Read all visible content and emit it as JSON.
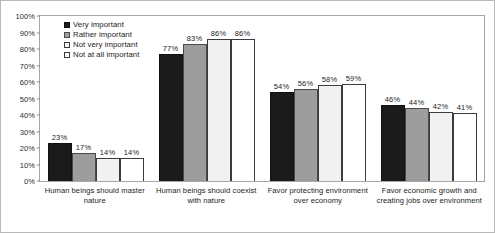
{
  "chart_data": {
    "type": "bar",
    "title": "",
    "xlabel": "",
    "ylabel": "",
    "ylim": [
      0,
      100
    ],
    "grid": false,
    "legend_position": "top-left-inside",
    "categories": [
      "Human beings should master nature",
      "Human beings should coexist with nature",
      "Favor protecting environment over economy",
      "Favor economic growth and creating jobs over environment"
    ],
    "series": [
      {
        "name": "Very important",
        "color": "#1b1b1b",
        "values": [
          23,
          77,
          54,
          46
        ]
      },
      {
        "name": "Rather important",
        "color": "#9d9d9d",
        "values": [
          17,
          83,
          56,
          44
        ]
      },
      {
        "name": "Not very important",
        "color": "#f1f1f1",
        "values": [
          14,
          86,
          58,
          42
        ]
      },
      {
        "name": "Not at all important",
        "color": "#ffffff",
        "values": [
          14,
          86,
          59,
          41
        ]
      }
    ],
    "value_labels": [
      [
        "23%",
        "17%",
        "14%",
        "14%"
      ],
      [
        "77%",
        "83%",
        "86%",
        "86%"
      ],
      [
        "54%",
        "56%",
        "58%",
        "59%"
      ],
      [
        "46%",
        "44%",
        "42%",
        "41%"
      ]
    ],
    "y_ticks": [
      "100%",
      "90%",
      "80%",
      "70%",
      "60%",
      "50%",
      "40%",
      "30%",
      "20%",
      "10%",
      "0%"
    ],
    "y_tick_values": [
      100,
      90,
      80,
      70,
      60,
      50,
      40,
      30,
      20,
      10,
      0
    ]
  },
  "legend": {
    "items": [
      {
        "label": "Very important"
      },
      {
        "label": "Rather important"
      },
      {
        "label": "Not very important"
      },
      {
        "label": "Not at all important"
      }
    ]
  },
  "axis": {
    "y_ticks": [
      "100%",
      "90%",
      "80%",
      "70%",
      "60%",
      "50%",
      "40%",
      "30%",
      "20%",
      "10%",
      "0%"
    ],
    "categories": [
      "Human beings should master nature",
      "Human beings should coexist with nature",
      "Favor protecting environment over economy",
      "Favor economic growth and creating jobs over environment"
    ]
  }
}
